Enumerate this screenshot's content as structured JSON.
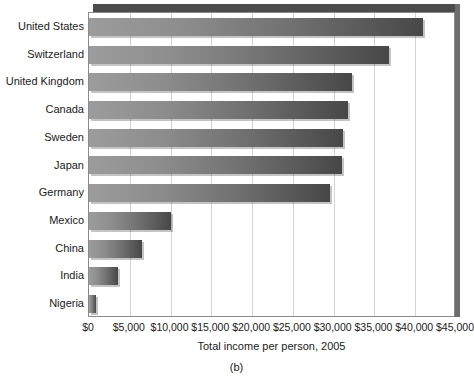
{
  "figure": {
    "caption": "(b)"
  },
  "chart_data": {
    "type": "bar",
    "orientation": "horizontal",
    "title": "",
    "xlabel": "Total income per person, 2005",
    "ylabel": "",
    "categories": [
      "United States",
      "Switzerland",
      "United Kingdom",
      "Canada",
      "Sweden",
      "Japan",
      "Germany",
      "Mexico",
      "China",
      "India",
      "Nigeria"
    ],
    "values": [
      41000,
      36800,
      32300,
      31700,
      31200,
      31000,
      29600,
      10100,
      6500,
      3500,
      800
    ],
    "xlim": [
      0,
      45000
    ],
    "xtick_values": [
      0,
      5000,
      10000,
      15000,
      20000,
      25000,
      30000,
      35000,
      40000,
      45000
    ],
    "xtick_labels": [
      "$0",
      "$5,000",
      "$10,000",
      "$15,000",
      "$20,000",
      "$25,000",
      "$30,000",
      "$35,000",
      "$40,000",
      "$45,000"
    ],
    "grid": "vertical",
    "legend": "none",
    "bar_color_start": "#9c9c9c",
    "bar_color_end": "#474747",
    "gridline_color": "#d4d4d4",
    "frame_color": "#8a8a8a",
    "shadow_color": "#4b4b4b"
  }
}
